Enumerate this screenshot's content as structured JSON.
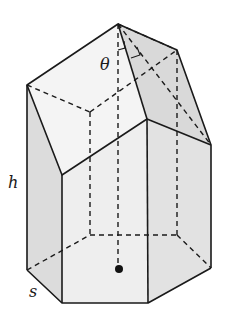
{
  "diagram": {
    "labels": {
      "angle": "θ",
      "height": "h",
      "side": "s"
    },
    "colors": {
      "stroke": "#1a1a1a",
      "face_light": "#f2f2f2",
      "face_mid": "#e4e4e4",
      "face_dark": "#d6d6d6"
    }
  }
}
